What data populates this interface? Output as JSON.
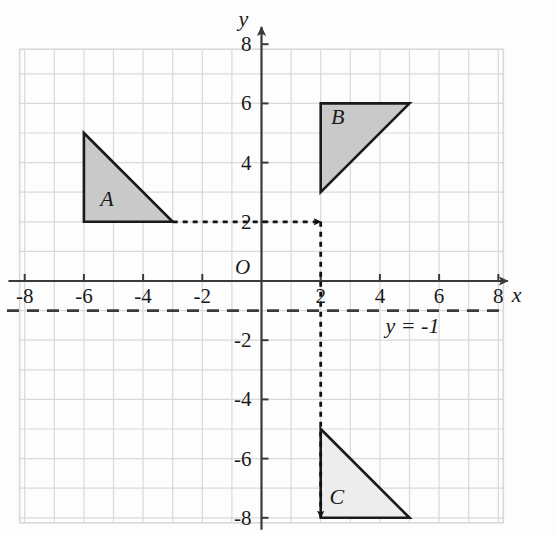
{
  "figure": {
    "axes": {
      "x_axis_name": "x",
      "y_axis_name": "y",
      "origin_label": "O",
      "x_tick_labels": [
        "-8",
        "-6",
        "-4",
        "-2",
        "2",
        "4",
        "6",
        "8"
      ],
      "y_tick_labels": [
        "8",
        "6",
        "4",
        "2",
        "-2",
        "-4",
        "-6",
        "-8"
      ],
      "x_ticks": [
        -8,
        -6,
        -4,
        -2,
        2,
        4,
        6,
        8
      ],
      "y_ticks": [
        8,
        6,
        4,
        2,
        -2,
        -4,
        -6,
        -8
      ],
      "xlim": [
        -9,
        8.2
      ],
      "ylim": [
        -8.4,
        9
      ],
      "grid": true,
      "grid_color": "#d9d9d9",
      "axis_color": "#3a3a3a"
    },
    "shapes": [
      {
        "label": "A",
        "label_x": -5.45,
        "label_y": 2.55,
        "points": [
          [
            -6,
            5
          ],
          [
            -6,
            2
          ],
          [
            -3,
            2
          ]
        ],
        "fill": "#c9c9c9",
        "stroke": "#1a1a1a"
      },
      {
        "label": "B",
        "label_x": 2.35,
        "label_y": 5.3,
        "points": [
          [
            2,
            6
          ],
          [
            2,
            3
          ],
          [
            5,
            6
          ]
        ],
        "fill": "#c9c9c9",
        "stroke": "#1a1a1a"
      },
      {
        "label": "C",
        "label_x": 2.3,
        "label_y": -7.55,
        "points": [
          [
            2,
            -5
          ],
          [
            2,
            -8
          ],
          [
            5,
            -8
          ]
        ],
        "fill": "#ededed",
        "stroke": "#1a1a1a"
      }
    ],
    "mirror_line": {
      "label": "y = -1",
      "label_x": 5.1,
      "label_y": -1.75,
      "y_value": -1,
      "x_from": -8.6,
      "x_to": 8.1,
      "color": "#3a3a3a",
      "dash": "12 8"
    },
    "arrows": [
      {
        "name": "arrow-a-to-b",
        "from": [
          -3,
          2
        ],
        "to": [
          2,
          2
        ],
        "color": "#111111",
        "dash": "5 5"
      },
      {
        "name": "arrow-b-to-c",
        "from": [
          2,
          2
        ],
        "to": [
          2,
          -8
        ],
        "color": "#111111",
        "dash": "5 5"
      }
    ]
  }
}
